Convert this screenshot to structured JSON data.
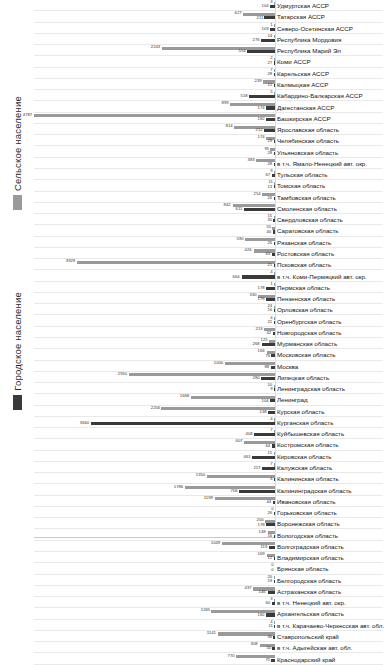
{
  "chart_data": {
    "type": "bar",
    "orientation": "horizontal",
    "title": "",
    "xlabel": "",
    "ylabel": "",
    "grid": true,
    "legend_position": "left-rotated",
    "xlim": [
      0,
      4787
    ],
    "series": [
      {
        "name": "Сельское население",
        "key": "rural",
        "color": "#9a9a9a"
      },
      {
        "name": "Городское население",
        "key": "urban",
        "color": "#3a3a3a"
      }
    ],
    "categories": [
      "Удмуртская АССР",
      "Татарская АССР",
      "Северо-Осетинская АССР",
      "Республика Мордовия",
      "Республика Марий Эл",
      "Коми АССР",
      "Карельская АССР",
      "Калмыцкая АССР",
      "Кабардино-Балкарская АССР",
      "Дагестанская АССР",
      "Башкирская АССР",
      "Ярославская область",
      "Челябинская область",
      "Ульяновская область",
      "в т.ч. Ямало-Ненецкий авт. окр.",
      "Тульская область",
      "Томская область",
      "Тамбовская область",
      "Смоленская область",
      "Свердловская область",
      "Саратовская область",
      "Рязанская область",
      "Ростовская область",
      "Псковская область",
      "в т.ч. Коми-Пермяцкий авт. окр.",
      "Пермская область",
      "Пензенская область",
      "Орловская область",
      "Оренбургская область",
      "Новгородская область",
      "Мурманская область",
      "Московская область",
      "Москва",
      "Липецкая область",
      "Ленинградская область",
      "Ленинград",
      "Курская область",
      "Курганская область",
      "Куйбышевская область",
      "Костромская область",
      "Кировская область",
      "Калужская область",
      "Калининская область",
      "Калининградская область",
      "Ивановская область",
      "Горьковская область",
      "Воронежская область",
      "Вологодская область",
      "Волгоградская область",
      "Владимирская область",
      "Брянская область",
      "Белгородская область",
      "Астраханская область",
      "в т.ч. Ненецкий авт. окр.",
      "Архангельская область",
      "в т.ч. Карачаево-Черкесская авт. обл.",
      "Ставропольский край",
      "в т.ч. Адыгейская авт. обл.",
      "Краснодарский край"
    ],
    "rural": [
      3,
      627,
      1,
      14,
      2243,
      2,
      7,
      239,
      5,
      899,
      4787,
      814,
      174,
      95,
      383,
      9,
      11,
      254,
      842,
      15,
      55,
      590,
      426,
      3929,
      4,
      1,
      330,
      24,
      4,
      213,
      125,
      166,
      1000,
      2910,
      10,
      1668,
      2256,
      4,
      7,
      607,
      15,
      7,
      1350,
      1786,
      1199,
      0,
      200,
      148,
      1049,
      169,
      0,
      20,
      437,
      3,
      1265,
      4,
      1141,
      308,
      770
    ],
    "urban": [
      104,
      211,
      103,
      276,
      554,
      27,
      28,
      15,
      518,
      174,
      182,
      212,
      29,
      28,
      28,
      67,
      13,
      26,
      611,
      35,
      40,
      26,
      63,
      21,
      664,
      178,
      176,
      16,
      21,
      42,
      268,
      76,
      88,
      280,
      9,
      104,
      138,
      3660,
      408,
      64,
      461,
      257,
      6,
      706,
      44,
      26,
      178,
      16,
      119,
      12,
      0,
      19,
      146,
      60,
      182,
      11,
      36,
      50,
      75,
      195,
      14,
      46,
      128,
      8,
      45,
      631,
      1529,
      551,
      272
    ]
  }
}
